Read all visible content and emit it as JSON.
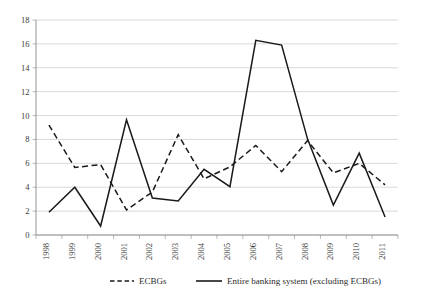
{
  "chart_data": {
    "type": "line",
    "title": "",
    "subtitle": "",
    "xlabel": "",
    "ylabel": "",
    "categories": [
      "1998",
      "1999",
      "2000",
      "2001",
      "2002",
      "2003",
      "2004",
      "2005",
      "2006",
      "2007",
      "2008",
      "2009",
      "2010",
      "2011"
    ],
    "series": [
      {
        "name": "ECBGs",
        "style": "dashed",
        "color": "#1a1a1a",
        "values": [
          9.2,
          5.65,
          5.9,
          2.1,
          3.6,
          8.4,
          4.7,
          5.7,
          7.5,
          5.3,
          7.9,
          5.2,
          6.0,
          4.2
        ]
      },
      {
        "name": "Entire banking system (excluding ECBGs)",
        "style": "solid",
        "color": "#1a1a1a",
        "values": [
          1.9,
          4.0,
          0.75,
          9.65,
          3.1,
          2.85,
          5.5,
          4.05,
          16.3,
          15.9,
          8.05,
          2.5,
          6.85,
          1.5
        ]
      }
    ],
    "ylim": [
      0,
      18
    ],
    "yticks": [
      0,
      2,
      4,
      6,
      8,
      10,
      12,
      14,
      16,
      18
    ],
    "ytick_labels": [
      "0",
      "2",
      "4",
      "6",
      "8",
      "10",
      "12",
      "14",
      "16",
      "18"
    ],
    "grid": true,
    "grid_axis": "y",
    "legend_position": "bottom",
    "xtick_rotation": -90
  },
  "legend": {
    "items": [
      {
        "label": "ECBGs",
        "style": "dashed"
      },
      {
        "label": "Entire banking system (excluding ECBGs)",
        "style": "solid"
      }
    ]
  },
  "colors": {
    "line": "#1a1a1a",
    "grid": "#c8c8c8",
    "axis": "#8a8a8a",
    "text": "#2b2b2b",
    "background": "#ffffff"
  }
}
